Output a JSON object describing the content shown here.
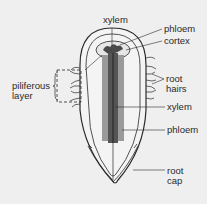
{
  "diagram": {
    "labels": {
      "xylem_top": "xylem",
      "phloem_top": "phloem",
      "cortex": "cortex",
      "root_hairs_1": "root",
      "root_hairs_2": "hairs",
      "piliferous_1": "piliferous",
      "piliferous_2": "layer",
      "xylem_mid": "xylem",
      "phloem_mid": "phloem",
      "root_cap_1": "root",
      "root_cap_2": "cap"
    },
    "colors": {
      "background": "#efefef",
      "line": "#2a2a2a",
      "xylem": "#555555",
      "phloem": "#9a9a9a"
    }
  }
}
